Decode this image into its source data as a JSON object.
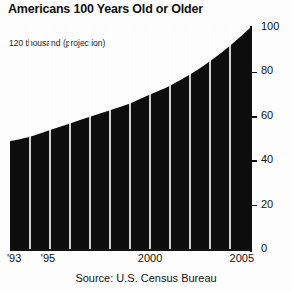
{
  "header": {
    "title": "Americans 100 Years Old or Older",
    "subtitle": "120 thousand (projection)"
  },
  "footer": {
    "source": "Source: U.S. Census Bureau"
  },
  "chart_data": {
    "type": "area",
    "title": "Americans 100 Years Old or Older",
    "subtitle": "120 thousand (projection)",
    "xlabel": "",
    "ylabel": "",
    "units": "thousand",
    "note": "120 thousand (projection)",
    "source": "Source: U.S. Census Bureau",
    "fill_color": "#0d0d0d",
    "band_line_color": "#ffffff",
    "axis_color": "#111111",
    "background_color": "#fdfdfd",
    "grid": false,
    "legend": "none",
    "ylim": [
      0,
      100
    ],
    "yticks": [
      0,
      20,
      40,
      60,
      80,
      100
    ],
    "ytick_labels": [
      "0",
      "20",
      "40",
      "60",
      "80",
      "100"
    ],
    "xlim": [
      1993,
      2005
    ],
    "xticks": [
      1993,
      1995,
      2000,
      2005
    ],
    "xtick_labels": [
      "'93",
      "'95",
      "2000",
      "2005"
    ],
    "x": [
      1993,
      1994,
      1995,
      1996,
      1997,
      1998,
      1999,
      2000,
      2001,
      2002,
      2003,
      2004,
      2005
    ],
    "values": [
      49,
      51,
      54,
      57,
      60,
      63,
      66,
      70,
      74,
      79,
      85,
      92,
      100
    ],
    "series": [
      {
        "name": "Americans 100 years old or older",
        "values": [
          49,
          51,
          54,
          57,
          60,
          63,
          66,
          70,
          74,
          79,
          85,
          92,
          100
        ]
      }
    ],
    "band_count": 12
  }
}
